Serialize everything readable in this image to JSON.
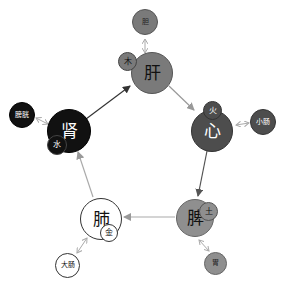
{
  "diagram": {
    "type": "five-elements-cycle",
    "organs": [
      {
        "id": "liver",
        "label": "肝",
        "element": "木",
        "fu": "胆",
        "color": "#7a7a7a",
        "text_color": "#111111"
      },
      {
        "id": "heart",
        "label": "心",
        "element": "火",
        "fu": "小肠",
        "color": "#4d4d4d",
        "text_color": "#ffffff"
      },
      {
        "id": "spleen",
        "label": "脾",
        "element": "土",
        "fu": "胃",
        "color": "#8f8f8f",
        "text_color": "#111111"
      },
      {
        "id": "lung",
        "label": "肺",
        "element": "金",
        "fu": "大肠",
        "color": "#ffffff",
        "text_color": "#111111"
      },
      {
        "id": "kidney",
        "label": "肾",
        "element": "水",
        "fu": "膀胱",
        "color": "#111111",
        "text_color": "#ffffff"
      }
    ],
    "cycle_arrows": [
      {
        "from": "肾",
        "to": "肝",
        "color": "#333333"
      },
      {
        "from": "肝",
        "to": "心",
        "color": "#999999"
      },
      {
        "from": "心",
        "to": "脾",
        "color": "#555555"
      },
      {
        "from": "脾",
        "to": "肺",
        "color": "#aaaaaa"
      },
      {
        "from": "肺",
        "to": "肾",
        "color": "#aaaaaa"
      }
    ],
    "pair_links": [
      {
        "organ": "肝",
        "fu": "胆"
      },
      {
        "organ": "心",
        "fu": "小肠"
      },
      {
        "organ": "脾",
        "fu": "胃"
      },
      {
        "organ": "肺",
        "fu": "大肠"
      },
      {
        "organ": "肾",
        "fu": "膀胱"
      }
    ]
  }
}
